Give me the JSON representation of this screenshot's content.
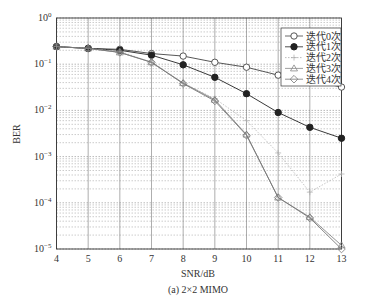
{
  "chart_data": {
    "type": "line",
    "title": "",
    "caption": "(a) 2×2 MIMO",
    "xlabel": "SNR/dB",
    "ylabel": "BER",
    "xlim": [
      4,
      13
    ],
    "ylim": [
      1e-05,
      1
    ],
    "yscale": "log",
    "x": [
      4,
      5,
      6,
      7,
      8,
      9,
      10,
      11,
      12,
      13
    ],
    "xticks": [
      "4",
      "5",
      "6",
      "7",
      "8",
      "9",
      "10",
      "11",
      "12",
      "13"
    ],
    "yticks": [
      "10^0",
      "10^-1",
      "10^-2",
      "10^-3",
      "10^-4",
      "10^-5"
    ],
    "grid": true,
    "legend_position": "upper right",
    "series": [
      {
        "name": "迭代0次",
        "marker": "circle-open",
        "style": "solid",
        "color": "#444444",
        "values": [
          0.24,
          0.22,
          0.21,
          0.17,
          0.15,
          0.11,
          0.086,
          0.058,
          0.045,
          0.032
        ]
      },
      {
        "name": "迭代1次",
        "marker": "circle-filled",
        "style": "solid",
        "color": "#222222",
        "values": [
          0.24,
          0.22,
          0.2,
          0.157,
          0.097,
          0.052,
          0.023,
          0.009,
          0.0043,
          0.0025
        ]
      },
      {
        "name": "迭代2次",
        "marker": "plus",
        "style": "dotted",
        "color": "#aaaaaa",
        "values": [
          0.24,
          0.22,
          0.19,
          0.11,
          0.039,
          0.018,
          0.006,
          0.0012,
          0.00017,
          0.00042
        ]
      },
      {
        "name": "迭代3次",
        "marker": "triangle-open",
        "style": "solid",
        "color": "#888888",
        "values": [
          0.24,
          0.22,
          0.18,
          0.11,
          0.039,
          0.017,
          0.003,
          0.00013,
          4.9e-05,
          1.2e-05
        ]
      },
      {
        "name": "迭代4次",
        "marker": "diamond-open",
        "style": "solid",
        "color": "#777777",
        "values": [
          0.24,
          0.22,
          0.18,
          0.11,
          0.038,
          0.016,
          0.0029,
          0.00013,
          4.7e-05,
          1e-05
        ]
      }
    ]
  }
}
